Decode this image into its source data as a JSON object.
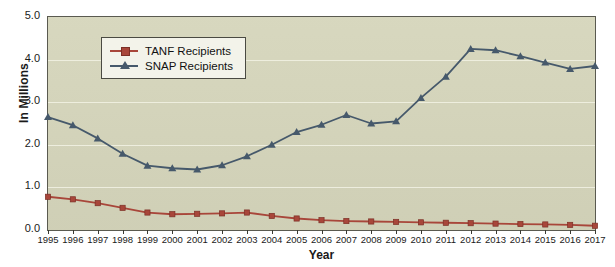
{
  "chart_data": {
    "type": "line",
    "title": "",
    "xlabel": "Year",
    "ylabel": "In Millions",
    "grid": true,
    "legend_position": "top-left",
    "xlim": [
      1995,
      2017
    ],
    "ylim": [
      0.0,
      5.0
    ],
    "ytick_labels": [
      "5.0",
      "4.0",
      "3.0",
      "2.0",
      "1.0",
      "0.0"
    ],
    "ytick_values": [
      5.0,
      4.0,
      3.0,
      2.0,
      1.0,
      0.0
    ],
    "categories": [
      1995,
      1996,
      1997,
      1998,
      1999,
      2000,
      2001,
      2002,
      2003,
      2004,
      2005,
      2006,
      2007,
      2008,
      2009,
      2010,
      2011,
      2012,
      2013,
      2014,
      2015,
      2016,
      2017
    ],
    "xtick_labels": [
      "1995",
      "1996",
      "1997",
      "1998",
      "1999",
      "2000",
      "2001",
      "2002",
      "2003",
      "2004",
      "2005",
      "2006",
      "2007",
      "2008",
      "2009",
      "2010",
      "2011",
      "2012",
      "2013",
      "2014",
      "2015",
      "2016",
      "2017"
    ],
    "series": [
      {
        "name": "TANF Recipients",
        "color": "#a8463a",
        "marker": "square",
        "values": [
          0.78,
          0.72,
          0.63,
          0.52,
          0.41,
          0.37,
          0.38,
          0.39,
          0.41,
          0.33,
          0.27,
          0.23,
          0.21,
          0.2,
          0.19,
          0.18,
          0.17,
          0.16,
          0.15,
          0.14,
          0.13,
          0.12,
          0.1
        ]
      },
      {
        "name": "SNAP Recipients",
        "color": "#46596b",
        "marker": "triangle",
        "values": [
          2.65,
          2.46,
          2.15,
          1.79,
          1.51,
          1.45,
          1.42,
          1.52,
          1.73,
          2.0,
          2.3,
          2.47,
          2.7,
          2.5,
          2.55,
          3.1,
          3.6,
          4.25,
          4.22,
          4.08,
          3.93,
          3.78,
          3.85
        ]
      }
    ]
  },
  "legend": {
    "items": [
      {
        "label": "TANF Recipients",
        "color": "#a8463a",
        "marker": "square"
      },
      {
        "label": "SNAP Recipients",
        "color": "#46596b",
        "marker": "triangle"
      }
    ]
  },
  "axes": {
    "y_title": "In Millions",
    "x_title": "Year"
  }
}
